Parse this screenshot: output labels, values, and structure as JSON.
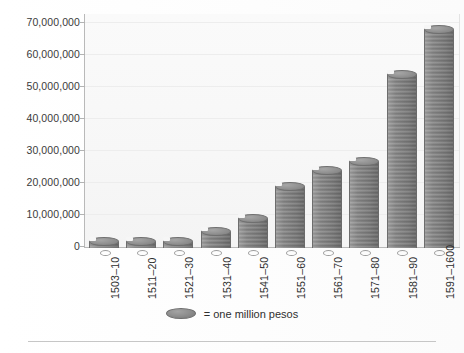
{
  "chart_data": {
    "type": "bar",
    "title": "",
    "subtitle": "",
    "xlabel": "",
    "ylabel": "",
    "categories": [
      "1503–10",
      "1511–20",
      "1521–30",
      "1531–40",
      "1541–50",
      "1551–60",
      "1561–70",
      "1571–80",
      "1581–90",
      "1591–1600"
    ],
    "values": [
      2000000,
      2000000,
      1500000,
      5000000,
      9000000,
      19000000,
      24000000,
      27000000,
      54000000,
      68000000
    ],
    "ylim": [
      0,
      70000000
    ],
    "ytick_values": [
      0,
      10000000,
      20000000,
      30000000,
      40000000,
      50000000,
      60000000,
      70000000
    ],
    "ytick_labels": [
      "0",
      "10,000,000",
      "20,000,000",
      "30,000,000",
      "40,000,000",
      "50,000,000",
      "60,000,000",
      "70,000,000"
    ],
    "grid": true,
    "legend_position": "bottom-center",
    "legend": [
      {
        "marker": "coin-ellipse",
        "label": "= one million pesos"
      }
    ],
    "unit_note": "each coin glyph represents one million pesos",
    "xtick_rotation": 90,
    "bar_style": "stacked-coin-pictogram"
  },
  "axis": {
    "y_labels": [
      "70,000,000",
      "60,000,000",
      "50,000,000",
      "40,000,000",
      "30,000,000",
      "20,000,000",
      "10,000,000",
      "0"
    ],
    "x_labels": [
      "1503–10",
      "1511–20",
      "1521–30",
      "1531–40",
      "1541–50",
      "1551–60",
      "1561–70",
      "1571–80",
      "1581–90",
      "1591–1600"
    ]
  },
  "legend": {
    "marker_name": "coin-icon",
    "text": "= one million pesos"
  },
  "colors": {
    "coin_face": "#949494",
    "coin_edge": "#6e6e6e",
    "background": "#fbfbfb",
    "axis": "#b9b9b9",
    "gridline": "#ededed",
    "text": "#2f2f2f",
    "rule": "#c6c6c6"
  }
}
